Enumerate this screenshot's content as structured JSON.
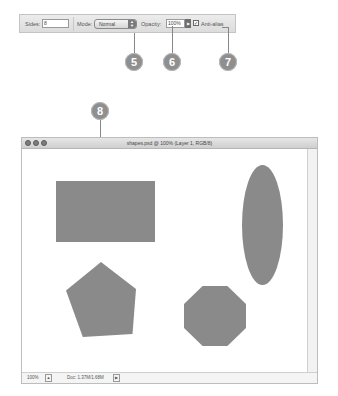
{
  "options_bar": {
    "sides_label": "Sides:",
    "sides_value": "8",
    "mode_label": "Mode:",
    "mode_value": "Normal",
    "opacity_label": "Opacity:",
    "opacity_value": "100%",
    "antialias_label": "Anti-alias",
    "antialias_checked": true
  },
  "callouts": [
    "5",
    "6",
    "7",
    "8"
  ],
  "document_window": {
    "title": "shapes.psd @ 100% (Layer 1, RGB/8)",
    "status": {
      "zoom": "100%",
      "doc_size": "Doc: 1.37M/1.68M"
    },
    "shapes": [
      "rectangle",
      "ellipse",
      "pentagon",
      "octagon"
    ],
    "shape_color": "#8a8a8a"
  }
}
